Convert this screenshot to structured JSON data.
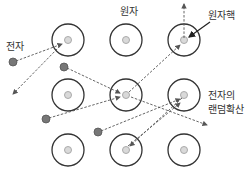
{
  "labels": {
    "atom": "원자",
    "nucleus": "원자핵",
    "electron": "전자",
    "random_diffusion_line1": "전자의",
    "random_diffusion_line2": "랜덤확산"
  },
  "colors": {
    "orbit": "#333333",
    "nucleus_fill": "#d9d9d9",
    "nucleus_stroke": "#aaaaaa",
    "electron_fill": "#777777",
    "arrow": "#555555"
  },
  "atoms": [
    {
      "cx": 68,
      "cy": 40
    },
    {
      "cx": 126,
      "cy": 40
    },
    {
      "cx": 184,
      "cy": 40
    },
    {
      "cx": 68,
      "cy": 95
    },
    {
      "cx": 126,
      "cy": 95
    },
    {
      "cx": 184,
      "cy": 95
    },
    {
      "cx": 68,
      "cy": 150
    },
    {
      "cx": 126,
      "cy": 150
    },
    {
      "cx": 184,
      "cy": 150
    }
  ],
  "electrons": [
    {
      "cx": 13,
      "cy": 62
    },
    {
      "cx": 64,
      "cy": 67
    },
    {
      "cx": 46,
      "cy": 119
    },
    {
      "cx": 98,
      "cy": 132
    }
  ]
}
